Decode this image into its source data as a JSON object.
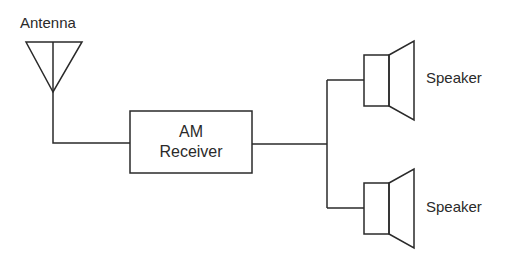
{
  "diagram": {
    "nodes": [
      {
        "id": "antenna",
        "label": "Antenna",
        "shape": "antenna-triangle"
      },
      {
        "id": "receiver",
        "label_line1": "AM",
        "label_line2": "Receiver",
        "shape": "rectangle"
      },
      {
        "id": "speaker1",
        "label": "Speaker",
        "shape": "speaker"
      },
      {
        "id": "speaker2",
        "label": "Speaker",
        "shape": "speaker"
      }
    ],
    "edges": [
      {
        "from": "antenna",
        "to": "receiver"
      },
      {
        "from": "receiver",
        "to": "speaker1"
      },
      {
        "from": "receiver",
        "to": "speaker2"
      }
    ],
    "colors": {
      "line": "#2a2a2a",
      "background": "#ffffff"
    }
  }
}
